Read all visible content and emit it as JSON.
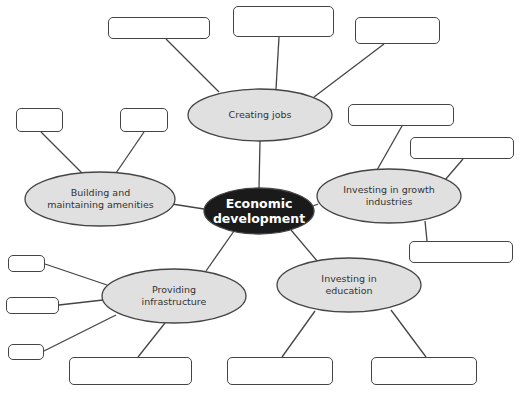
{
  "diagram": {
    "type": "mind-map",
    "center": {
      "label": "Economic development",
      "line1": "Economic",
      "line2": "development",
      "fill": "#1a1a1a",
      "text_color": "#ffffff"
    },
    "branches": [
      {
        "id": "jobs",
        "line1": "Creating jobs",
        "line2": "",
        "fill": "#e0e0e0",
        "blank_boxes": 3
      },
      {
        "id": "amenities",
        "line1": "Building and",
        "line2": "maintaining amenities",
        "fill": "#e0e0e0",
        "blank_boxes": 2
      },
      {
        "id": "growth",
        "line1": "Investing in growth",
        "line2": "industries",
        "fill": "#e0e0e0",
        "blank_boxes": 3
      },
      {
        "id": "infrastructure",
        "line1": "Providing",
        "line2": "infrastructure",
        "fill": "#e0e0e0",
        "blank_boxes": 4
      },
      {
        "id": "education",
        "line1": "Investing in",
        "line2": "education",
        "fill": "#e0e0e0",
        "blank_boxes": 2
      }
    ],
    "colors": {
      "stroke": "#444444",
      "node_fill": "#e0e0e0",
      "center_fill": "#1a1a1a",
      "background": "#ffffff"
    }
  }
}
